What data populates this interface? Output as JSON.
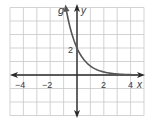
{
  "chart_data": {
    "type": "line",
    "title": "",
    "xlabel": "x",
    "ylabel": "y",
    "xlim": [
      -5,
      5
    ],
    "ylim": [
      -3,
      5
    ],
    "grid": true,
    "x_ticks_labeled": [
      -4,
      -2,
      2,
      4
    ],
    "x_tick_labels": [
      "−4",
      "−2",
      "2",
      "4"
    ],
    "y_ticks_labeled": [
      2
    ],
    "y_tick_labels": [
      "2"
    ],
    "series": [
      {
        "name": "g",
        "function": "g(x) = 2(1/3)^x",
        "x": [
          -0.9,
          -0.5,
          0,
          0.5,
          1,
          1.5,
          2,
          3,
          4,
          5
        ],
        "y": [
          5.37,
          3.46,
          2.0,
          1.15,
          0.67,
          0.38,
          0.22,
          0.07,
          0.02,
          0.01
        ],
        "color": "#555555"
      }
    ],
    "annotations": [
      "g"
    ],
    "legend": "none"
  },
  "labels": {
    "curve_name": "g",
    "x_axis": "x",
    "y_axis": "y",
    "x_ticks": [
      "−4",
      "−2",
      "2",
      "4"
    ],
    "y_tick": "2"
  },
  "colors": {
    "grid": "#c8c8c8",
    "axis": "#2a2a2a",
    "curve": "#555555",
    "text": "#3a3a3a"
  }
}
